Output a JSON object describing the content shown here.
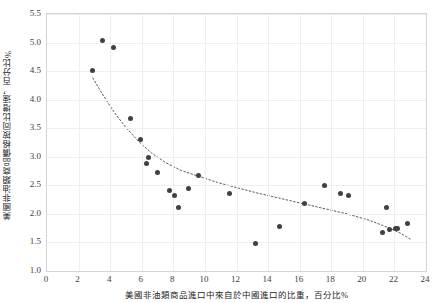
{
  "chart_data": {
    "type": "scatter",
    "title": "",
    "xlabel": "美國非油類商品進口中來自於中國進口的比重，百分比%",
    "ylabel": "美國非油類商品價格按同比增速，百分比%",
    "xlim": [
      0,
      24
    ],
    "ylim": [
      1.0,
      5.5
    ],
    "xticks": [
      0,
      2,
      4,
      6,
      8,
      10,
      12,
      14,
      16,
      18,
      20,
      22,
      24
    ],
    "yticks": [
      1.0,
      1.5,
      2.0,
      2.5,
      3.0,
      3.5,
      4.0,
      4.5,
      5.0,
      5.5
    ],
    "xtick_labels": [
      "0",
      "2",
      "4",
      "6",
      "8",
      "10",
      "12",
      "14",
      "16",
      "18",
      "20",
      "22",
      "24"
    ],
    "ytick_labels": [
      "1.0",
      "1.5",
      "2.0",
      "2.5",
      "3.0",
      "3.5",
      "4.0",
      "4.5",
      "5.0",
      "5.5"
    ],
    "grid": true,
    "legend": false,
    "marker_color": "#404040",
    "grid_color": "#eceff1",
    "axis_color": "#d4d4d4",
    "trendline": {
      "style": "dotted",
      "color": "#595959",
      "type": "power",
      "points": [
        [
          2.9,
          4.38
        ],
        [
          3.5,
          4.1
        ],
        [
          4.2,
          3.8
        ],
        [
          5.0,
          3.51
        ],
        [
          5.8,
          3.27
        ],
        [
          6.6,
          3.07
        ],
        [
          7.5,
          2.9
        ],
        [
          8.5,
          2.76
        ],
        [
          9.6,
          2.66
        ],
        [
          10.8,
          2.55
        ],
        [
          12.0,
          2.46
        ],
        [
          13.4,
          2.36
        ],
        [
          14.8,
          2.27
        ],
        [
          16.2,
          2.18
        ],
        [
          17.6,
          2.09
        ],
        [
          19.0,
          2.0
        ],
        [
          20.4,
          1.89
        ],
        [
          21.6,
          1.76
        ],
        [
          22.4,
          1.66
        ],
        [
          23.0,
          1.56
        ]
      ]
    },
    "points": [
      {
        "x": 2.85,
        "y": 4.51
      },
      {
        "x": 3.52,
        "y": 5.03
      },
      {
        "x": 4.18,
        "y": 4.92
      },
      {
        "x": 5.3,
        "y": 3.67
      },
      {
        "x": 5.92,
        "y": 3.31
      },
      {
        "x": 6.42,
        "y": 2.99
      },
      {
        "x": 6.28,
        "y": 2.88
      },
      {
        "x": 7.02,
        "y": 2.72
      },
      {
        "x": 7.78,
        "y": 2.41
      },
      {
        "x": 8.1,
        "y": 2.33
      },
      {
        "x": 8.32,
        "y": 2.11
      },
      {
        "x": 8.95,
        "y": 2.45
      },
      {
        "x": 9.62,
        "y": 2.68
      },
      {
        "x": 11.55,
        "y": 2.35
      },
      {
        "x": 13.22,
        "y": 1.48
      },
      {
        "x": 14.75,
        "y": 1.78
      },
      {
        "x": 16.32,
        "y": 2.19
      },
      {
        "x": 17.6,
        "y": 2.5
      },
      {
        "x": 18.6,
        "y": 2.36
      },
      {
        "x": 19.1,
        "y": 2.33
      },
      {
        "x": 21.5,
        "y": 2.12
      },
      {
        "x": 21.22,
        "y": 1.68
      },
      {
        "x": 21.72,
        "y": 1.72
      },
      {
        "x": 22.05,
        "y": 1.75
      },
      {
        "x": 22.18,
        "y": 1.75
      },
      {
        "x": 22.85,
        "y": 1.84
      }
    ]
  }
}
